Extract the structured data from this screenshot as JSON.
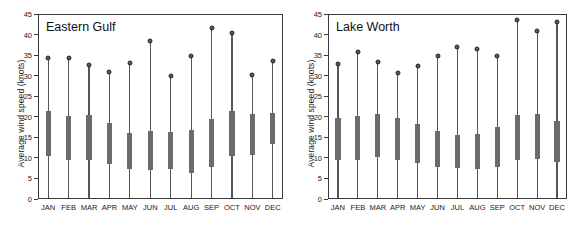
{
  "figure": {
    "width": 574,
    "height": 227,
    "panel_count": 2
  },
  "chart_data": [
    {
      "type": "bar",
      "title": "Eastern Gulf",
      "xlabel": "",
      "ylabel": "Average wind speed (knots)",
      "ylim": [
        0,
        45
      ],
      "yticks": [
        0,
        5,
        10,
        15,
        20,
        25,
        30,
        35,
        40,
        45
      ],
      "ytick_labels": [
        "0",
        "5",
        "10",
        "15",
        "20",
        "25",
        "30",
        "35",
        "40",
        "45"
      ],
      "grid": false,
      "legend": "none",
      "categories": [
        "JAN",
        "FEB",
        "MAR",
        "APR",
        "MAY",
        "JUN",
        "JUL",
        "AUG",
        "SEP",
        "OCT",
        "NOV",
        "DEC"
      ],
      "series": [
        {
          "name": "maximum",
          "values": [
            34.2,
            34.4,
            32.7,
            31.0,
            33.2,
            38.5,
            29.9,
            34.9,
            41.6,
            40.3,
            30.1,
            33.5
          ]
        },
        {
          "name": "whisker_low",
          "values": [
            0.4,
            0.4,
            0.3,
            0.3,
            0.3,
            0.3,
            0.3,
            0.3,
            0.3,
            0.3,
            0.3,
            0.3
          ]
        },
        {
          "name": "box_top",
          "values": [
            21.4,
            20.3,
            20.5,
            18.4,
            16.1,
            16.6,
            16.3,
            16.8,
            19.4,
            21.4,
            20.6,
            20.8
          ]
        },
        {
          "name": "box_bottom",
          "values": [
            10.4,
            9.4,
            9.6,
            8.6,
            7.4,
            7.0,
            7.2,
            6.4,
            7.8,
            10.4,
            10.7,
            13.3
          ]
        }
      ]
    },
    {
      "type": "bar",
      "title": "Lake Worth",
      "xlabel": "",
      "ylabel": "Average wind speed (knots)",
      "ylim": [
        0,
        45
      ],
      "yticks": [
        0,
        5,
        10,
        15,
        20,
        25,
        30,
        35,
        40,
        45
      ],
      "ytick_labels": [
        "0",
        "5",
        "10",
        "15",
        "20",
        "25",
        "30",
        "35",
        "40",
        "45"
      ],
      "grid": false,
      "legend": "none",
      "categories": [
        "JAN",
        "FEB",
        "MAR",
        "APR",
        "MAY",
        "JUN",
        "JUL",
        "AUG",
        "SEP",
        "OCT",
        "NOV",
        "DEC"
      ],
      "series": [
        {
          "name": "maximum",
          "values": [
            32.8,
            35.7,
            33.4,
            30.6,
            32.3,
            34.7,
            36.9,
            36.4,
            34.8,
            43.5,
            40.9,
            43.1
          ]
        },
        {
          "name": "whisker_low",
          "values": [
            0.3,
            0.3,
            0.3,
            0.3,
            0.3,
            0.3,
            0.3,
            0.3,
            0.3,
            0.3,
            0.3,
            0.3
          ]
        },
        {
          "name": "box_top",
          "values": [
            19.8,
            20.3,
            20.6,
            19.7,
            18.3,
            16.5,
            15.6,
            15.7,
            17.6,
            20.4,
            20.7,
            19.0
          ]
        },
        {
          "name": "box_bottom",
          "values": [
            9.6,
            9.5,
            10.2,
            9.5,
            8.8,
            7.9,
            7.6,
            7.2,
            7.9,
            9.4,
            9.7,
            8.9
          ]
        }
      ]
    }
  ]
}
